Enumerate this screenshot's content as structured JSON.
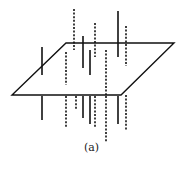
{
  "figure": {
    "caption": "(a)",
    "stroke_color": "#111111",
    "plane": {
      "shape": "parallelogram",
      "vertices": [
        [
          66,
          43
        ],
        [
          174,
          43
        ],
        [
          121,
          95
        ],
        [
          12,
          95
        ]
      ]
    },
    "solid_segments": [
      {
        "x": 42,
        "y1": 47,
        "y2": 75
      },
      {
        "x": 42,
        "y1": 96,
        "y2": 120
      },
      {
        "x": 83,
        "y1": 36,
        "y2": 68
      },
      {
        "x": 83,
        "y1": 96,
        "y2": 118
      },
      {
        "x": 90,
        "y1": 50,
        "y2": 75
      },
      {
        "x": 90,
        "y1": 96,
        "y2": 124
      },
      {
        "x": 118,
        "y1": 11,
        "y2": 57
      },
      {
        "x": 118,
        "y1": 96,
        "y2": 124
      }
    ],
    "dashed_segments": [
      {
        "x": 74,
        "y1": 9,
        "y2": 50
      },
      {
        "x": 66,
        "y1": 52,
        "y2": 85
      },
      {
        "x": 66,
        "y1": 96,
        "y2": 127
      },
      {
        "x": 76,
        "y1": 96,
        "y2": 110
      },
      {
        "x": 95,
        "y1": 23,
        "y2": 57
      },
      {
        "x": 95,
        "y1": 96,
        "y2": 127
      },
      {
        "x": 106,
        "y1": 50,
        "y2": 95
      },
      {
        "x": 106,
        "y1": 96,
        "y2": 142
      },
      {
        "x": 126,
        "y1": 26,
        "y2": 66
      },
      {
        "x": 126,
        "y1": 95,
        "y2": 131
      }
    ]
  }
}
